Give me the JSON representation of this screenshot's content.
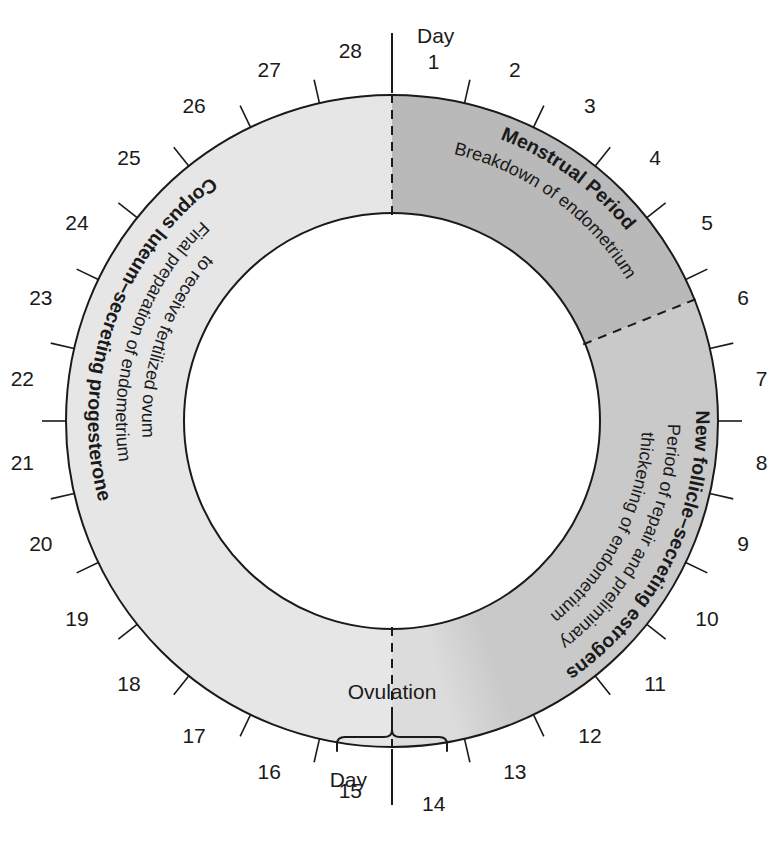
{
  "diagram": {
    "type": "radial-cycle-chart",
    "cycle_length_days": 28,
    "ovulation_label": "Ovulation",
    "day_word_top": "Day",
    "day_word_bottom": "Day",
    "colors": {
      "menstrual_fill": "#b9b9b9",
      "follicular_fill": "#c9c9c9",
      "ovulatory_fill": "#dcdcdc",
      "luteal_fill": "#e6e6e6",
      "outline": "#1a1a1a",
      "background": "#ffffff",
      "text": "#1a1a1a"
    },
    "geometry": {
      "center_x": 392,
      "center_y": 421,
      "outer_radius": 326,
      "inner_radius": 208,
      "tick_outer_radius": 350,
      "number_radius": 372
    },
    "day_labels": [
      "1",
      "2",
      "3",
      "4",
      "5",
      "6",
      "7",
      "8",
      "9",
      "10",
      "11",
      "12",
      "13",
      "14",
      "15",
      "16",
      "17",
      "18",
      "19",
      "20",
      "21",
      "22",
      "23",
      "24",
      "25",
      "26",
      "27",
      "28"
    ],
    "phases": [
      {
        "id": "menstrual",
        "title": "Menstrual Period",
        "description": "Breakdown of endometrium",
        "start_day": 0,
        "end_day": 5.3,
        "fill": "#b9b9b9"
      },
      {
        "id": "follicular",
        "title": "New follicle–secreting estrogens",
        "description_line1": "Period of repair and preliminary",
        "description_line2": "thickening of endometrium",
        "description": "Period of repair and preliminary thickening of endometrium",
        "start_day": 5.3,
        "end_day": 12.6,
        "fill": "#c9c9c9"
      },
      {
        "id": "ovulatory",
        "title": "Ovulation",
        "description": "",
        "start_day": 12.6,
        "end_day": 14,
        "fill": "#dcdcdc"
      },
      {
        "id": "luteal",
        "title": "Corpus luteum–secreting progesterone",
        "description_line1": "Final preparation of endometrium",
        "description_line2": "to receive fertilized ovum",
        "description": "Final preparation of endometrium to receive fertilized ovum",
        "start_day": 14,
        "end_day": 28,
        "fill": "#e6e6e6"
      }
    ],
    "boundary_markers": [
      {
        "id": "day1-marker",
        "day": 0,
        "style": "dashed-with-solid-stem"
      },
      {
        "id": "day5-6-marker",
        "day": 5.3,
        "style": "dashed"
      },
      {
        "id": "day14-marker",
        "day": 14,
        "style": "dashed-with-solid-stem"
      }
    ]
  },
  "chart_data": {
    "type": "pie",
    "xlabel": "",
    "ylabel": "",
    "categories": [
      "Menstrual Period",
      "New follicle–secreting estrogens",
      "Ovulation",
      "Corpus luteum–secreting progesterone"
    ],
    "values": [
      5.3,
      7.3,
      1.4,
      14
    ],
    "units": "days",
    "total": 28,
    "tick_labels": [
      "1",
      "2",
      "3",
      "4",
      "5",
      "6",
      "7",
      "8",
      "9",
      "10",
      "11",
      "12",
      "13",
      "14",
      "15",
      "16",
      "17",
      "18",
      "19",
      "20",
      "21",
      "22",
      "23",
      "24",
      "25",
      "26",
      "27",
      "28"
    ],
    "annotations": [
      "Day 1",
      "Day 14",
      "Ovulation",
      "Breakdown of endometrium",
      "Period of repair and preliminary thickening of endometrium",
      "Final preparation of endometrium to receive fertilized ovum"
    ],
    "legend": "none",
    "grid": false
  }
}
